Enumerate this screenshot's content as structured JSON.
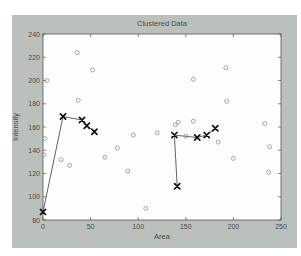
{
  "figure": {
    "background_color": "#bcc0bc",
    "plot_background_color": "#fdfdfd",
    "axis_color": "#555555",
    "text_color": "#4a4a4a"
  },
  "chart_data": {
    "type": "scatter",
    "title": "Clustered Data",
    "xlabel": "Area",
    "ylabel": "Intensity",
    "xlim": [
      0,
      250
    ],
    "ylim": [
      80,
      240
    ],
    "xticks": [
      0,
      50,
      100,
      150,
      200,
      250
    ],
    "yticks": [
      80,
      100,
      120,
      140,
      160,
      180,
      200,
      220,
      240
    ],
    "grid": false,
    "series": [
      {
        "name": "unclustered-points",
        "marker": "o",
        "marker_color": "#8f8f8f",
        "line": false,
        "points": [
          [
            4,
            200
          ],
          [
            36,
            224
          ],
          [
            52,
            209
          ],
          [
            37,
            183
          ],
          [
            2,
            150
          ],
          [
            1,
            136
          ],
          [
            19,
            132
          ],
          [
            28,
            127
          ],
          [
            65,
            134
          ],
          [
            78,
            142
          ],
          [
            89,
            122
          ],
          [
            95,
            153
          ],
          [
            120,
            155
          ],
          [
            108,
            90
          ],
          [
            139,
            162
          ],
          [
            142,
            164
          ],
          [
            150,
            152
          ],
          [
            158,
            165
          ],
          [
            158,
            201
          ],
          [
            192,
            211
          ],
          [
            193,
            182
          ],
          [
            184,
            147
          ],
          [
            200,
            133
          ],
          [
            233,
            163
          ],
          [
            238,
            143
          ],
          [
            237,
            121
          ]
        ]
      },
      {
        "name": "cluster-1-path",
        "marker": "x",
        "marker_color": "#111111",
        "line": true,
        "line_color": "#3a3a3a",
        "points": [
          [
            0,
            87
          ],
          [
            21,
            169
          ],
          [
            41,
            166
          ],
          [
            46,
            161
          ],
          [
            54,
            156
          ]
        ]
      },
      {
        "name": "cluster-2-path",
        "marker": "x",
        "marker_color": "#111111",
        "line": true,
        "line_color": "#3a3a3a",
        "points": [
          [
            141,
            109
          ],
          [
            138,
            153
          ],
          [
            162,
            151
          ],
          [
            172,
            153
          ],
          [
            181,
            159
          ]
        ]
      }
    ]
  }
}
